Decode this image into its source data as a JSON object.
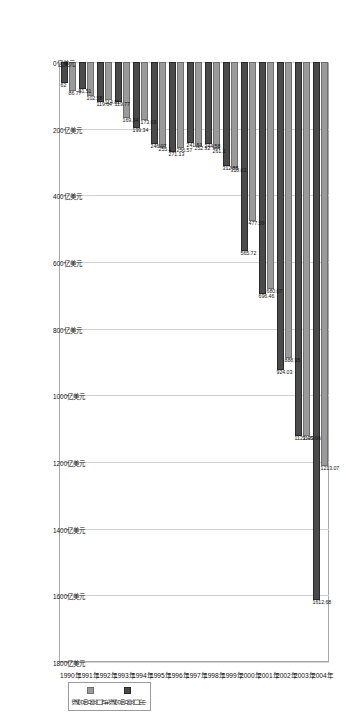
{
  "chart_data": {
    "type": "bar",
    "orientation": "horizontal",
    "title": "",
    "xlabel": "",
    "ylabel": "",
    "unit": "亿美元",
    "grid": true,
    "legend_position": "bottom-right",
    "xlim": [
      0,
      1800
    ],
    "categories": [
      "1990年",
      "1991年",
      "1992年",
      "1993年",
      "1994年",
      "1995年",
      "1996年",
      "1997年",
      "1998年",
      "1999年",
      "2000年",
      "2001年",
      "2002年",
      "2003年",
      "2004年"
    ],
    "tick_labels": [
      "0亿美元",
      "200亿美元",
      "400亿美元",
      "600亿美元",
      "800亿美元",
      "1000亿美元",
      "1200亿美元",
      "1400亿美元",
      "1600亿美元",
      "1800亿美元"
    ],
    "tick_values": [
      0,
      200,
      400,
      600,
      800,
      1000,
      1200,
      1400,
      1600,
      1800
    ],
    "series": [
      {
        "name": "进口商品总额",
        "key": "imp",
        "color": "#9a9a9a",
        "values": [
          86.77,
          102.58,
          114.81,
          169.34,
          173.09,
          255.1,
          256.57,
          252.32,
          261.3,
          318.63,
          477.59,
          680.07,
          888.95,
          1123.06,
          1213.07
        ],
        "labels": [
          "86.77",
          "102.58",
          "114.81",
          "169.34",
          "173.09",
          "255.1",
          "256.57",
          "252.32",
          "261.3",
          "318.63",
          "477.59",
          "680.07",
          "888.95",
          "1123.06",
          "1213.07"
        ]
      },
      {
        "name": "出口商品总额",
        "key": "exp",
        "color": "#4a4a4a",
        "values": [
          62.0,
          81.51,
          119.64,
          119.77,
          199.34,
          246.07,
          271.13,
          241.51,
          244.58,
          312.88,
          565.72,
          696.46,
          924.03,
          1123.46,
          1612.68
        ],
        "labels": [
          "62",
          "81.51",
          "119.64",
          "119.77",
          "199.34",
          "246.07",
          "271.13",
          "241.51",
          "244.58",
          "312.88",
          "565.72",
          "696.46",
          "924.03",
          "1123.46",
          "1612.68"
        ]
      }
    ]
  }
}
